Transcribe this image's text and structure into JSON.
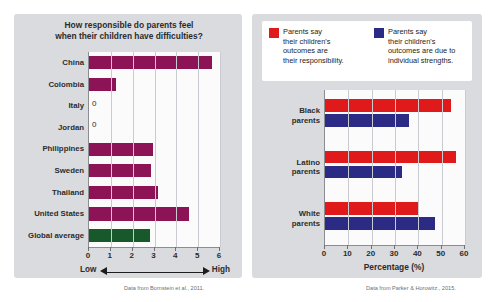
{
  "figure": {
    "background": "#ffffff",
    "panel_background": "#d9dbdf"
  },
  "left_panel": {
    "credit": "Data from Bornstein et al., 2011."
  },
  "right_panel": {
    "credit": "Data from Parker & Horowitz., 2015."
  },
  "chart_data": [
    {
      "type": "bar",
      "orientation": "horizontal",
      "title": "How responsible do parents feel when their children have difficulties?",
      "title_line1": "How responsible do parents feel",
      "title_line2": "when their children have difficulties?",
      "xlabel": "",
      "ylabel": "",
      "xlim": [
        0,
        6
      ],
      "xticks": [
        0,
        1,
        2,
        3,
        4,
        5,
        6
      ],
      "xtick_labels": [
        "0",
        "1",
        "2",
        "3",
        "4",
        "5",
        "6"
      ],
      "grid": true,
      "axis_low_label": "Low",
      "axis_high_label": "High",
      "categories": [
        "China",
        "Colombia",
        "Italy",
        "Jordan",
        "Philippines",
        "Sweden",
        "Thailand",
        "United States",
        "Global average"
      ],
      "values": [
        5.65,
        1.25,
        0,
        0,
        2.95,
        2.85,
        3.15,
        4.6,
        2.8
      ],
      "zero_labels": {
        "Italy": "0",
        "Jordan": "0"
      },
      "bar_color": "#8c1356",
      "highlight_color": "#17592a",
      "highlight_category": "Global average"
    },
    {
      "type": "bar",
      "orientation": "horizontal",
      "title": "",
      "xlabel": "Percentage (%)",
      "ylabel": "",
      "xlim": [
        0,
        60
      ],
      "xticks": [
        0,
        10,
        20,
        30,
        40,
        50,
        60
      ],
      "xtick_labels": [
        "0",
        "10",
        "20",
        "30",
        "40",
        "50",
        "60"
      ],
      "grid": true,
      "legend_position": "top",
      "categories": [
        "Black parents",
        "Latino parents",
        "White parents"
      ],
      "category_lines": [
        [
          "Black",
          "parents"
        ],
        [
          "Latino",
          "parents"
        ],
        [
          "White",
          "parents"
        ]
      ],
      "series": [
        {
          "name": "Parents say their children's outcomes are their responsibility.",
          "legend_line1": "Parents say",
          "legend_line2": "their children's",
          "legend_line3": "outcomes are",
          "legend_line4": "their responsibility.",
          "color": "#e0191b",
          "values": [
            54,
            56,
            40
          ]
        },
        {
          "name": "Parents say their children's outcomes are due to individual strengths.",
          "legend_line1": "Parents say",
          "legend_line2": "their children's",
          "legend_line3": "outcomes are due to",
          "legend_line4": "individual strengths.",
          "color": "#2b2b86",
          "values": [
            36,
            33,
            47
          ]
        }
      ]
    }
  ]
}
